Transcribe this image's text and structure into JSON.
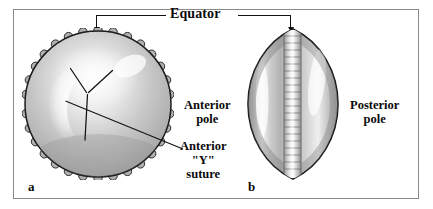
{
  "figure": {
    "panels": [
      {
        "letter": "a",
        "view": "anterior-face",
        "description": "Scalloped circular lens viewed from the anterior face showing the Y suture"
      },
      {
        "letter": "b",
        "view": "equatorial-profile",
        "description": "Lens viewed in profile showing anterior and posterior poles and lamellae at the equator"
      }
    ],
    "callouts": {
      "equator": "Equator",
      "anterior_pole": "Anterior\npole",
      "anterior_pole_line1": "Anterior",
      "anterior_pole_line2": "pole",
      "posterior_pole_line1": "Posterior",
      "posterior_pole_line2": "pole",
      "y_suture_line1": "Anterior",
      "y_suture_line2": "\"Y\"",
      "y_suture_line3": "suture"
    },
    "colors": {
      "frame": "#8a8a8a",
      "ink": "#0a0a0a",
      "background": "#ffffff",
      "specimen_mid": "#b4b4b4",
      "specimen_light": "#f2f2f2",
      "specimen_dark": "#8e8e8e",
      "outline": "#1a1a1a"
    }
  }
}
